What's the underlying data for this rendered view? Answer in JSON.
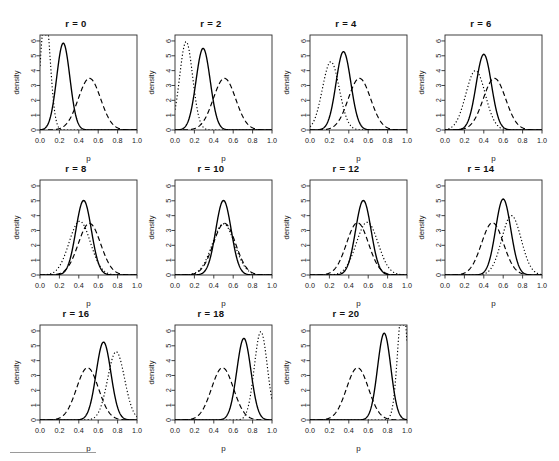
{
  "figure": {
    "layout": {
      "rows": 3,
      "cols": 4,
      "panel_count": 11
    },
    "axis": {
      "xlabel": "p",
      "ylabel": "density",
      "xticks": [
        "0.0",
        "0.2",
        "0.4",
        "0.6",
        "0.8",
        "1.0"
      ],
      "yticks": [
        "0",
        "1",
        "2",
        "3",
        "4",
        "5",
        "6"
      ]
    },
    "footer_rule": true
  },
  "chart_data": {
    "type": "line",
    "title": "",
    "xlabel": "p",
    "ylabel": "density",
    "xlim": [
      0,
      1
    ],
    "ylim": [
      0,
      6.4
    ],
    "xticks": [
      0.0,
      0.2,
      0.4,
      0.6,
      0.8,
      1.0
    ],
    "yticks": [
      0,
      1,
      2,
      3,
      4,
      5,
      6
    ],
    "grid": false,
    "legend": "none",
    "series_styles": [
      {
        "name": "posterior",
        "linestyle": "solid",
        "color": "#000000"
      },
      {
        "name": "prior-A",
        "linestyle": "dashed",
        "color": "#000000"
      },
      {
        "name": "prior-B",
        "linestyle": "dotted",
        "color": "#000000"
      }
    ],
    "panels": [
      {
        "title": "r = 0",
        "curves": [
          {
            "style": "solid",
            "mean": 0.24,
            "sd": 0.068,
            "peak": 5.85
          },
          {
            "style": "dashed",
            "mean": 0.51,
            "sd": 0.115,
            "peak": 3.48
          },
          {
            "style": "dotted",
            "mean": 0.055,
            "sd": 0.05,
            "peak": 7.9
          }
        ]
      },
      {
        "title": "r = 2",
        "curves": [
          {
            "style": "solid",
            "mean": 0.29,
            "sd": 0.073,
            "peak": 5.5
          },
          {
            "style": "dashed",
            "mean": 0.51,
            "sd": 0.115,
            "peak": 3.48
          },
          {
            "style": "dotted",
            "mean": 0.115,
            "sd": 0.067,
            "peak": 5.95
          }
        ]
      },
      {
        "title": "r = 4",
        "curves": [
          {
            "style": "solid",
            "mean": 0.345,
            "sd": 0.076,
            "peak": 5.28
          },
          {
            "style": "dashed",
            "mean": 0.51,
            "sd": 0.115,
            "peak": 3.48
          },
          {
            "style": "dotted",
            "mean": 0.215,
            "sd": 0.087,
            "peak": 4.6
          }
        ]
      },
      {
        "title": "r = 6",
        "curves": [
          {
            "style": "solid",
            "mean": 0.4,
            "sd": 0.0785,
            "peak": 5.1
          },
          {
            "style": "dashed",
            "mean": 0.51,
            "sd": 0.115,
            "peak": 3.48
          },
          {
            "style": "dotted",
            "mean": 0.315,
            "sd": 0.1,
            "peak": 4.0
          }
        ]
      },
      {
        "title": "r = 8",
        "curves": [
          {
            "style": "solid",
            "mean": 0.45,
            "sd": 0.0795,
            "peak": 5.02
          },
          {
            "style": "dashed",
            "mean": 0.51,
            "sd": 0.115,
            "peak": 3.48
          },
          {
            "style": "dotted",
            "mean": 0.41,
            "sd": 0.11,
            "peak": 3.62
          }
        ]
      },
      {
        "title": "r = 10",
        "curves": [
          {
            "style": "solid",
            "mean": 0.5,
            "sd": 0.0795,
            "peak": 5.02
          },
          {
            "style": "dashed",
            "mean": 0.51,
            "sd": 0.115,
            "peak": 3.48
          },
          {
            "style": "dotted",
            "mean": 0.5,
            "sd": 0.115,
            "peak": 3.45
          }
        ]
      },
      {
        "title": "r = 12",
        "curves": [
          {
            "style": "solid",
            "mean": 0.55,
            "sd": 0.0795,
            "peak": 5.02
          },
          {
            "style": "dashed",
            "mean": 0.49,
            "sd": 0.113,
            "peak": 3.52
          },
          {
            "style": "dotted",
            "mean": 0.59,
            "sd": 0.112,
            "peak": 3.55
          }
        ]
      },
      {
        "title": "r = 14",
        "curves": [
          {
            "style": "solid",
            "mean": 0.6,
            "sd": 0.078,
            "peak": 5.12
          },
          {
            "style": "dashed",
            "mean": 0.49,
            "sd": 0.113,
            "peak": 3.52
          },
          {
            "style": "dotted",
            "mean": 0.685,
            "sd": 0.1,
            "peak": 4.0
          }
        ]
      },
      {
        "title": "r = 16",
        "curves": [
          {
            "style": "solid",
            "mean": 0.655,
            "sd": 0.076,
            "peak": 5.25
          },
          {
            "style": "dashed",
            "mean": 0.49,
            "sd": 0.113,
            "peak": 3.52
          },
          {
            "style": "dotted",
            "mean": 0.785,
            "sd": 0.087,
            "peak": 4.6
          }
        ]
      },
      {
        "title": "r = 18",
        "curves": [
          {
            "style": "solid",
            "mean": 0.71,
            "sd": 0.0727,
            "peak": 5.5
          },
          {
            "style": "dashed",
            "mean": 0.49,
            "sd": 0.113,
            "peak": 3.52
          },
          {
            "style": "dotted",
            "mean": 0.885,
            "sd": 0.067,
            "peak": 5.95
          }
        ]
      },
      {
        "title": "r = 20",
        "curves": [
          {
            "style": "solid",
            "mean": 0.765,
            "sd": 0.0684,
            "peak": 5.85
          },
          {
            "style": "dashed",
            "mean": 0.49,
            "sd": 0.113,
            "peak": 3.52
          },
          {
            "style": "dotted",
            "mean": 0.955,
            "sd": 0.05,
            "peak": 7.9
          }
        ]
      }
    ]
  }
}
